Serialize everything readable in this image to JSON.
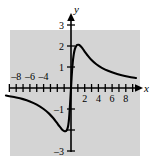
{
  "figure": {
    "background_color": "#ffffff",
    "panel_color": "#d4d4d4",
    "curve_color": "#000000",
    "axis_color": "#000000"
  },
  "chart_data": {
    "type": "line",
    "title": "",
    "subtitle": "",
    "xlabel": "x",
    "ylabel": "y",
    "xlim": [
      -9.6,
      9.6
    ],
    "ylim": [
      -3.9,
      3.9
    ],
    "grid": false,
    "legend": null,
    "annotations": [],
    "x_ticks": [
      -9,
      -8,
      -7,
      -6,
      -5,
      -4,
      -3,
      -2,
      -1,
      1,
      2,
      3,
      4,
      5,
      6,
      7,
      8,
      9
    ],
    "x_tick_labels": [
      {
        "value": -8,
        "text": "–8"
      },
      {
        "value": -6,
        "text": "–6"
      },
      {
        "value": -4,
        "text": "–4"
      },
      {
        "value": 2,
        "text": "2"
      },
      {
        "value": 4,
        "text": "4"
      },
      {
        "value": 6,
        "text": "6"
      },
      {
        "value": 8,
        "text": "8"
      }
    ],
    "y_ticks": [
      -3,
      -2,
      -1,
      1,
      2,
      3
    ],
    "y_tick_labels": [
      {
        "value": 3,
        "text": "3"
      },
      {
        "value": 2,
        "text": "2"
      },
      {
        "value": 1,
        "text": "1"
      },
      {
        "value": -1,
        "text": "–1"
      },
      {
        "value": -3,
        "text": "–3"
      }
    ],
    "series": [
      {
        "name": "curve-left-branch",
        "points": [
          [
            -9.5,
            -0.36
          ],
          [
            -9.0,
            -0.39
          ],
          [
            -8.0,
            -0.45
          ],
          [
            -7.0,
            -0.53
          ],
          [
            -6.0,
            -0.64
          ],
          [
            -5.0,
            -0.79
          ],
          [
            -4.0,
            -1.0
          ],
          [
            -3.2,
            -1.22
          ],
          [
            -2.6,
            -1.43
          ],
          [
            -2.1,
            -1.64
          ],
          [
            -1.7,
            -1.82
          ],
          [
            -1.35,
            -1.96
          ],
          [
            -1.05,
            -2.04
          ],
          [
            -0.8,
            -2.06
          ],
          [
            -0.6,
            -2.0
          ],
          [
            -0.45,
            -1.86
          ],
          [
            -0.33,
            -1.6
          ],
          [
            -0.24,
            -1.26
          ],
          [
            -0.16,
            -0.88
          ],
          [
            -0.09,
            -0.5
          ],
          [
            -0.03,
            -0.17
          ],
          [
            0.0,
            0.0
          ]
        ]
      },
      {
        "name": "curve-right-branch",
        "points": [
          [
            0.0,
            0.0
          ],
          [
            0.05,
            0.28
          ],
          [
            0.12,
            0.66
          ],
          [
            0.2,
            1.02
          ],
          [
            0.3,
            1.36
          ],
          [
            0.42,
            1.64
          ],
          [
            0.56,
            1.85
          ],
          [
            0.72,
            1.98
          ],
          [
            0.9,
            2.05
          ],
          [
            1.1,
            2.06
          ],
          [
            1.32,
            2.02
          ],
          [
            1.6,
            1.92
          ],
          [
            1.95,
            1.76
          ],
          [
            2.4,
            1.56
          ],
          [
            3.0,
            1.33
          ],
          [
            3.7,
            1.13
          ],
          [
            4.5,
            0.96
          ],
          [
            5.4,
            0.82
          ],
          [
            6.4,
            0.7
          ],
          [
            7.4,
            0.61
          ],
          [
            8.4,
            0.54
          ],
          [
            9.5,
            0.48
          ]
        ]
      }
    ]
  }
}
